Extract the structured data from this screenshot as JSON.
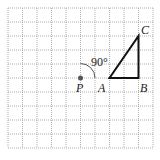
{
  "diagram": {
    "type": "geometry-rotation",
    "grid": {
      "columns": 10,
      "rows": 10,
      "origin_x": 8,
      "origin_y": 8,
      "cell_w": 14.5,
      "cell_h": 14,
      "line_color": "#9a9a9a",
      "style": "dotted"
    },
    "points": {
      "P": {
        "label": "P",
        "col": 5,
        "row": 5
      },
      "A": {
        "label": "A",
        "col": 7,
        "row": 5
      },
      "B": {
        "label": "B",
        "col": 9,
        "row": 5
      },
      "C": {
        "label": "C",
        "col": 9,
        "row": 2
      }
    },
    "triangle": {
      "vertices": [
        "A",
        "B",
        "C"
      ],
      "stroke": "#111111"
    },
    "rotation": {
      "center": "P",
      "angle_label": "90°",
      "direction": "clockwise"
    },
    "colors": {
      "center_dot": "#555555",
      "stroke": "#111111"
    }
  }
}
